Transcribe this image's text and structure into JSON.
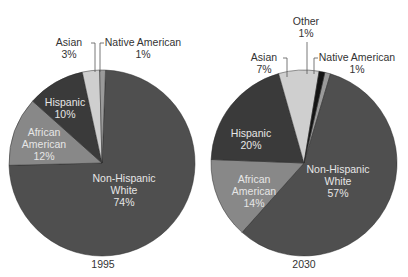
{
  "colors": {
    "non_hispanic_white": "#4f4f4f",
    "african_american": "#888888",
    "hispanic": "#3a3a3a",
    "asian": "#cfcfcf",
    "native_american": "#9a9a9a",
    "other": "#141414",
    "leader_line": "#555555"
  },
  "charts": [
    {
      "year_label": "1995",
      "labels": {
        "asian_name": "Asian",
        "asian_pct": "3%",
        "native_name": "Native American",
        "native_pct": "1%",
        "hispanic_name": "Hispanic",
        "hispanic_pct": "10%",
        "african_name_1": "African",
        "african_name_2": "American",
        "african_pct": "12%",
        "white_name_1": "Non-Hispanic",
        "white_name_2": "White",
        "white_pct": "74%"
      }
    },
    {
      "year_label": "2030",
      "labels": {
        "other_name": "Other",
        "other_pct": "1%",
        "asian_name": "Asian",
        "asian_pct": "7%",
        "native_name": "Native American",
        "native_pct": "1%",
        "hispanic_name": "Hispanic",
        "hispanic_pct": "20%",
        "african_name_1": "African",
        "african_name_2": "American",
        "african_pct": "14%",
        "white_name_1": "Non-Hispanic",
        "white_name_2": "White",
        "white_pct": "57%"
      }
    }
  ],
  "chart_data": [
    {
      "type": "pie",
      "title": "1995",
      "categories": [
        "Non-Hispanic White",
        "African American",
        "Hispanic",
        "Asian",
        "Native American"
      ],
      "values": [
        74,
        12,
        10,
        3,
        1
      ],
      "unit": "%"
    },
    {
      "type": "pie",
      "title": "2030",
      "categories": [
        "Non-Hispanic White",
        "African American",
        "Hispanic",
        "Asian",
        "Other",
        "Native American"
      ],
      "values": [
        57,
        14,
        20,
        7,
        1,
        1
      ],
      "unit": "%"
    }
  ]
}
